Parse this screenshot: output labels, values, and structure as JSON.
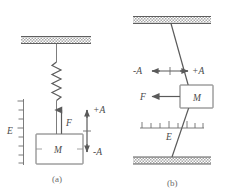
{
  "figure": {
    "background_color": "#ffffff",
    "line_color": "#6e6e6e",
    "label_color": "#4a4a4a",
    "hatch_color": "#9a9a9a",
    "width": 227,
    "height": 194
  },
  "panel_a": {
    "caption": "(a)",
    "type": "vertical-spring-mass",
    "mass_label": "M",
    "force_label": "F",
    "energy_label": "E",
    "amplitude_positive": "+A",
    "amplitude_negative": "-A",
    "support_label": "ceiling-hatched-support",
    "scale_tick_count": 8,
    "spring_coil_count": 6,
    "force_direction": "up",
    "amplitude_arrow_direction": "vertical-double"
  },
  "panel_b": {
    "caption": "(b)",
    "type": "transverse-string-mass",
    "mass_label": "M",
    "force_label": "F",
    "energy_label": "E",
    "amplitude_positive": "+A",
    "amplitude_negative": "-A",
    "support_top_label": "ceiling-hatched-support",
    "support_bottom_label": "floor-hatched-support",
    "scale_tick_count": 8,
    "force_direction": "left",
    "amplitude_arrow_direction": "horizontal-double"
  }
}
